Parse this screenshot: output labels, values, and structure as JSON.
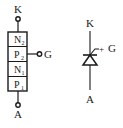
{
  "structure": {
    "terminal_top": "K",
    "terminal_bottom": "A",
    "terminal_gate": "G",
    "layers": [
      {
        "base": "N",
        "sub": "2"
      },
      {
        "base": "P",
        "sub": "2"
      },
      {
        "base": "N",
        "sub": "1"
      },
      {
        "base": "P",
        "sub": "1"
      }
    ]
  },
  "symbol": {
    "terminal_top": "K",
    "terminal_bottom": "A",
    "gate_label": "G",
    "gate_sign": "+"
  },
  "colors": {
    "ink": "#1a1a1a",
    "layer_fill": "#ffffff"
  }
}
